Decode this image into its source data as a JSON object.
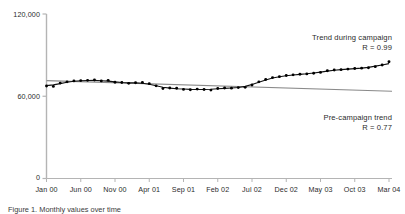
{
  "chart_data": {
    "type": "scatter",
    "title": "",
    "xlabel": "",
    "ylabel": "",
    "grid": false,
    "legend_position": "inline-annotations",
    "ylim": [
      0,
      120000
    ],
    "ytick_labels": [
      "0",
      "60,000",
      "120,000"
    ],
    "ytick_values": [
      0,
      60000,
      120000
    ],
    "xtick_labels": [
      "Jan 00",
      "Jun 00",
      "Nov 00",
      "Apr 01",
      "Sep 01",
      "Feb 02",
      "Jul 02",
      "Dec 02",
      "May 03",
      "Oct 03",
      "Mar 04"
    ],
    "xtick_indices": [
      0,
      5,
      10,
      15,
      20,
      25,
      30,
      35,
      40,
      45,
      50
    ],
    "x": [
      "Jan 00",
      "Feb 00",
      "Mar 00",
      "Apr 00",
      "May 00",
      "Jun 00",
      "Jul 00",
      "Aug 00",
      "Sep 00",
      "Oct 00",
      "Nov 00",
      "Dec 00",
      "Jan 01",
      "Feb 01",
      "Mar 01",
      "Apr 01",
      "May 01",
      "Jun 01",
      "Jul 01",
      "Aug 01",
      "Sep 01",
      "Oct 01",
      "Nov 01",
      "Dec 01",
      "Jan 02",
      "Feb 02",
      "Mar 02",
      "Apr 02",
      "May 02",
      "Jun 02",
      "Jul 02",
      "Aug 02",
      "Sep 02",
      "Oct 02",
      "Nov 02",
      "Dec 02",
      "Jan 03",
      "Feb 03",
      "Mar 03",
      "Apr 03",
      "May 03",
      "Jun 03",
      "Jul 03",
      "Aug 03",
      "Sep 03",
      "Oct 03",
      "Nov 03",
      "Dec 03",
      "Jan 04",
      "Feb 04",
      "Mar 04"
    ],
    "series": [
      {
        "name": "Observed monthly values",
        "marker": "dot",
        "color": "#000000",
        "values": [
          67500,
          67200,
          69600,
          70500,
          71200,
          71400,
          71600,
          71800,
          71200,
          71600,
          70200,
          70000,
          69400,
          69800,
          70100,
          69200,
          67600,
          65600,
          66000,
          65800,
          65000,
          64700,
          65200,
          64900,
          64500,
          65700,
          66000,
          65900,
          66300,
          66500,
          68200,
          70500,
          72200,
          73600,
          74300,
          75100,
          75600,
          76000,
          76300,
          76800,
          77400,
          78600,
          79100,
          79400,
          79800,
          80200,
          80500,
          80800,
          81600,
          82800,
          85200
        ]
      },
      {
        "name": "Fitted curve",
        "marker": "line",
        "color": "#111111"
      }
    ],
    "trend_lines": [
      {
        "name": "Pre-campaign trend",
        "label": "Pre-campaign trend",
        "r_label": "R = 0.77",
        "r_value": 0.77,
        "color": "#8a8a8a",
        "start_value": 71400,
        "end_value": 63600
      },
      {
        "name": "Trend during campaign",
        "label": "Trend during campaign",
        "r_label": "R = 0.99",
        "r_value": 0.99,
        "color": "#111111",
        "start_value": 65500,
        "end_value": 84000
      }
    ]
  },
  "annotations": {
    "campaign_title": "Trend during campaign",
    "campaign_r": "R = 0.99",
    "precampaign_title": "Pre-campaign trend",
    "precampaign_r": "R = 0.77"
  },
  "caption": {
    "text": "Figure 1. Monthly values over time"
  },
  "colors": {
    "axis": "#b4b4b4",
    "marker": "#000000",
    "fit": "#111111",
    "precampaign": "#8a8a8a",
    "text": "#2b2b2b"
  }
}
